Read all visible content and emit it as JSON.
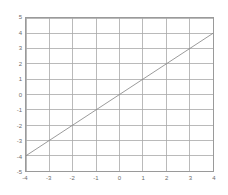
{
  "chart_data": {
    "type": "line",
    "title": "",
    "xlabel": "",
    "ylabel": "",
    "xlim": [
      -4,
      4
    ],
    "ylim": [
      -5,
      5
    ],
    "grid": true,
    "legend": null,
    "x_ticks": [
      "-4",
      "-3",
      "-2",
      "-1",
      "0",
      "1",
      "2",
      "3",
      "4"
    ],
    "x_tick_values": [
      -4,
      -3,
      -2,
      -1,
      0,
      1,
      2,
      3,
      4
    ],
    "y_ticks": [
      "5",
      "4",
      "3",
      "2",
      "1",
      "0",
      "-1",
      "-2",
      "-3",
      "-4",
      "-5"
    ],
    "y_tick_values": [
      5,
      4,
      3,
      2,
      1,
      0,
      -1,
      -2,
      -3,
      -4,
      -5
    ],
    "series": [
      {
        "name": "y = x",
        "x": [
          -4,
          -3,
          -2,
          -1,
          0,
          1,
          2,
          3,
          4
        ],
        "values": [
          -4,
          -3,
          -2,
          -1,
          0,
          1,
          2,
          3,
          4
        ],
        "color": "#808080",
        "linewidth": 0.8
      }
    ]
  },
  "style": {
    "background": "#ffffff",
    "axes_color": "#9a9a9a",
    "grid_color": "#a8a8a8",
    "tick_label_color": "#6b6b6b",
    "line_color": "#808080"
  }
}
